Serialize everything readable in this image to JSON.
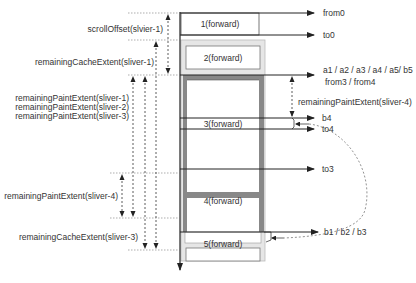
{
  "diagram": {
    "colors": {
      "line": "#222222",
      "dashed": "#444444",
      "cache_fill": "#e8e8e8",
      "paint_frame": "#888888",
      "box_fill": "#ffffff",
      "text": "#333333"
    },
    "slivers": [
      {
        "id": "1",
        "label": "1(forward)"
      },
      {
        "id": "2",
        "label": "2(forward)"
      },
      {
        "id": "3",
        "label": "3(forward)"
      },
      {
        "id": "4",
        "label": "4(forward)"
      },
      {
        "id": "5",
        "label": "5(forward)"
      }
    ],
    "left_labels": {
      "scroll_offset": "scrollOffset(slvier-1)",
      "remaining_cache_1": "remainingCacheExtent(sliver-1)",
      "remaining_paint_1": "remainingPaintExtent(sliver-1)",
      "remaining_paint_2": "remainingPaintExtent(sliver-2)",
      "remaining_paint_3": "remainingPaintExtent(sliver-3)",
      "remaining_paint_4": "remainingPaintExtent(sliver-4)",
      "remaining_cache_3": "remainingCacheExtent(sliver-3)"
    },
    "right_labels": {
      "from0": "from0",
      "to0": "to0",
      "a_line1": "a1 / a2 / a3 / a4 / a5/ b5",
      "a_line2": "from3 / from4",
      "remaining_paint_4_right": "remainingPaintExtent(sliver-4)",
      "b4": "b4",
      "to4": "to4",
      "to3": "to3",
      "b123": "b1 / b2 / b3"
    }
  }
}
